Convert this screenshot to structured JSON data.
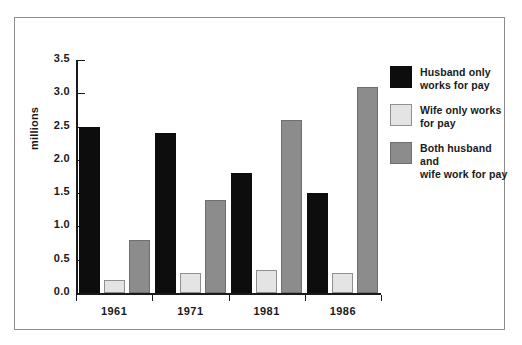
{
  "chart_data": {
    "type": "bar",
    "title": "",
    "xlabel": "",
    "ylabel": "millions",
    "categories": [
      "1961",
      "1971",
      "1981",
      "1986"
    ],
    "series": [
      {
        "name": "Husband only works for pay",
        "color": "#0d0d0d",
        "values": [
          2.5,
          2.4,
          1.8,
          1.5
        ]
      },
      {
        "name": "Wife only works for pay",
        "color": "#e4e4e4",
        "values": [
          0.2,
          0.3,
          0.35,
          0.3
        ]
      },
      {
        "name": "Both husband and wife work for pay",
        "color": "#8c8c8c",
        "values": [
          0.8,
          1.4,
          2.6,
          3.1
        ]
      }
    ],
    "ylim": [
      0.0,
      3.5
    ],
    "ytick_values": [
      0.0,
      0.5,
      1.0,
      1.5,
      2.0,
      2.5,
      3.0,
      3.5
    ],
    "ytick_labels": [
      "0.0",
      "0.5",
      "1.0",
      "1.5",
      "2.0",
      "2.5",
      "3.0",
      "3.5"
    ],
    "grid": false,
    "legend_position": "right"
  },
  "legend": {
    "entries": [
      {
        "label_line1": "Husband only",
        "label_line2": "works for pay"
      },
      {
        "label_line1": "Wife only works",
        "label_line2": "for pay"
      },
      {
        "label_line1": "Both husband and",
        "label_line2": "wife work for pay"
      }
    ]
  }
}
